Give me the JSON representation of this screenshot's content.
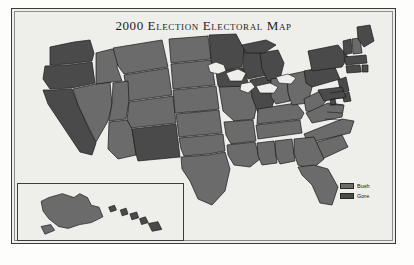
{
  "figure": {
    "title": "2000 Election Electoral Map",
    "background_color": "#eeeeea",
    "border_color": "#3b3b3b"
  },
  "legend": {
    "position": "bottom-right",
    "items": [
      {
        "label": "Bush",
        "color": "#6b6b6b"
      },
      {
        "label": "Gore",
        "color": "#4a4a4a"
      }
    ]
  },
  "inset": {
    "name": "alaska-hawaii-inset",
    "regions": [
      {
        "label": "Alaska",
        "winner": "Bush"
      },
      {
        "label": "Hawaii",
        "winner": "Gore"
      }
    ]
  },
  "chart_data": {
    "type": "map",
    "title": "2000 Election Electoral Map",
    "subtitle": "",
    "xlabel": "",
    "ylabel": "",
    "legend_position": "bottom-right",
    "grid": false,
    "categories": [
      "Bush",
      "Gore"
    ],
    "colors": {
      "Bush": "#6b6b6b",
      "Gore": "#4a4a4a"
    },
    "series": [
      {
        "name": "Bush",
        "values": 30
      },
      {
        "name": "Gore",
        "values": 21
      }
    ],
    "regions": [
      {
        "code": "AL",
        "name": "Alabama",
        "winner": "Bush"
      },
      {
        "code": "AK",
        "name": "Alaska",
        "winner": "Bush"
      },
      {
        "code": "AZ",
        "name": "Arizona",
        "winner": "Bush"
      },
      {
        "code": "AR",
        "name": "Arkansas",
        "winner": "Bush"
      },
      {
        "code": "CA",
        "name": "California",
        "winner": "Gore"
      },
      {
        "code": "CO",
        "name": "Colorado",
        "winner": "Bush"
      },
      {
        "code": "CT",
        "name": "Connecticut",
        "winner": "Gore"
      },
      {
        "code": "DE",
        "name": "Delaware",
        "winner": "Gore"
      },
      {
        "code": "DC",
        "name": "District of Columbia",
        "winner": "Gore"
      },
      {
        "code": "FL",
        "name": "Florida",
        "winner": "Bush"
      },
      {
        "code": "GA",
        "name": "Georgia",
        "winner": "Bush"
      },
      {
        "code": "HI",
        "name": "Hawaii",
        "winner": "Gore"
      },
      {
        "code": "ID",
        "name": "Idaho",
        "winner": "Bush"
      },
      {
        "code": "IL",
        "name": "Illinois",
        "winner": "Gore"
      },
      {
        "code": "IN",
        "name": "Indiana",
        "winner": "Bush"
      },
      {
        "code": "IA",
        "name": "Iowa",
        "winner": "Gore"
      },
      {
        "code": "KS",
        "name": "Kansas",
        "winner": "Bush"
      },
      {
        "code": "KY",
        "name": "Kentucky",
        "winner": "Bush"
      },
      {
        "code": "LA",
        "name": "Louisiana",
        "winner": "Bush"
      },
      {
        "code": "ME",
        "name": "Maine",
        "winner": "Gore"
      },
      {
        "code": "MD",
        "name": "Maryland",
        "winner": "Gore"
      },
      {
        "code": "MA",
        "name": "Massachusetts",
        "winner": "Gore"
      },
      {
        "code": "MI",
        "name": "Michigan",
        "winner": "Gore"
      },
      {
        "code": "MN",
        "name": "Minnesota",
        "winner": "Gore"
      },
      {
        "code": "MS",
        "name": "Mississippi",
        "winner": "Bush"
      },
      {
        "code": "MO",
        "name": "Missouri",
        "winner": "Bush"
      },
      {
        "code": "MT",
        "name": "Montana",
        "winner": "Bush"
      },
      {
        "code": "NE",
        "name": "Nebraska",
        "winner": "Bush"
      },
      {
        "code": "NV",
        "name": "Nevada",
        "winner": "Bush"
      },
      {
        "code": "NH",
        "name": "New Hampshire",
        "winner": "Bush"
      },
      {
        "code": "NJ",
        "name": "New Jersey",
        "winner": "Gore"
      },
      {
        "code": "NM",
        "name": "New Mexico",
        "winner": "Gore"
      },
      {
        "code": "NY",
        "name": "New York",
        "winner": "Gore"
      },
      {
        "code": "NC",
        "name": "North Carolina",
        "winner": "Bush"
      },
      {
        "code": "ND",
        "name": "North Dakota",
        "winner": "Bush"
      },
      {
        "code": "OH",
        "name": "Ohio",
        "winner": "Bush"
      },
      {
        "code": "OK",
        "name": "Oklahoma",
        "winner": "Bush"
      },
      {
        "code": "OR",
        "name": "Oregon",
        "winner": "Gore"
      },
      {
        "code": "PA",
        "name": "Pennsylvania",
        "winner": "Gore"
      },
      {
        "code": "RI",
        "name": "Rhode Island",
        "winner": "Gore"
      },
      {
        "code": "SC",
        "name": "South Carolina",
        "winner": "Bush"
      },
      {
        "code": "SD",
        "name": "South Dakota",
        "winner": "Bush"
      },
      {
        "code": "TN",
        "name": "Tennessee",
        "winner": "Bush"
      },
      {
        "code": "TX",
        "name": "Texas",
        "winner": "Bush"
      },
      {
        "code": "UT",
        "name": "Utah",
        "winner": "Bush"
      },
      {
        "code": "VT",
        "name": "Vermont",
        "winner": "Gore"
      },
      {
        "code": "VA",
        "name": "Virginia",
        "winner": "Bush"
      },
      {
        "code": "WA",
        "name": "Washington",
        "winner": "Gore"
      },
      {
        "code": "WV",
        "name": "West Virginia",
        "winner": "Bush"
      },
      {
        "code": "WI",
        "name": "Wisconsin",
        "winner": "Gore"
      },
      {
        "code": "WY",
        "name": "Wyoming",
        "winner": "Bush"
      }
    ]
  }
}
